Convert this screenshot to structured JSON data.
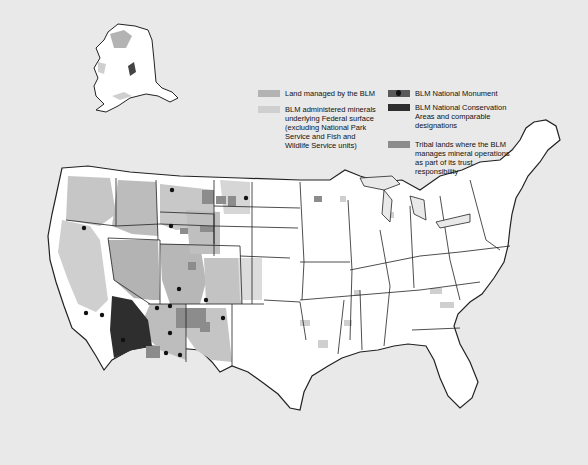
{
  "map": {
    "title": "BLM managed lands and mineral estate",
    "colors": {
      "background": "#e9e9e9",
      "land": "#ffffff",
      "blm_land": "#b3b3b3",
      "minerals": "#cfcfcf",
      "monument": "#5a5a5a",
      "conservation": "#2e2e2e",
      "tribal": "#8c8c8c",
      "border": "#222222"
    }
  },
  "legend": {
    "items": [
      {
        "label": "Land managed by the BLM",
        "key": "blm_land"
      },
      {
        "label": "BLM administered minerals underlying Federal surface (excluding National Park Service and Fish and Wildlife Service units)",
        "key": "minerals"
      },
      {
        "label": "BLM National Monument",
        "key": "monument",
        "icon": "monument-marker-icon"
      },
      {
        "label": "BLM National Conservation Areas and comparable designations",
        "key": "conservation"
      },
      {
        "label": "Tribal lands where the BLM manages mineral operations as part of its trust responsibility",
        "key": "tribal"
      }
    ]
  }
}
